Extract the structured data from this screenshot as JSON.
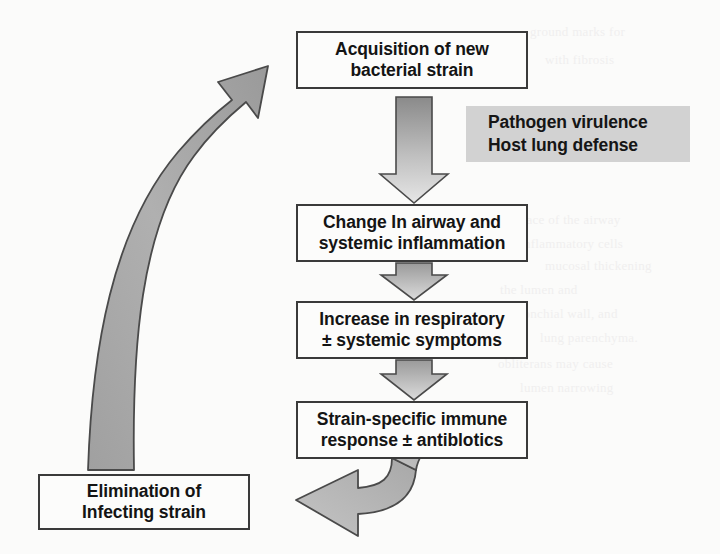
{
  "diagram": {
    "type": "cyclic-flowchart",
    "colors": {
      "box_border": "#3a3a3a",
      "box_fill": "#fcfcfb",
      "annotation_fill": "#d2d2d2",
      "arrow_fill_dark": "#8f8f8f",
      "arrow_fill_light": "#d8d8d8",
      "arrow_stroke": "#4a4a4a",
      "page_background": "#fbfbfa"
    },
    "nodes": [
      {
        "id": "acquisition",
        "line1": "Acquisition of new",
        "line2": "bacterial strain"
      },
      {
        "id": "inflammation",
        "line1": "Change In airway and",
        "line2": "systemic inflammation"
      },
      {
        "id": "symptoms",
        "line1": "Increase in respiratory",
        "line2": "± systemic symptoms"
      },
      {
        "id": "immune-response",
        "line1": "Strain-specific immune",
        "line2": "response ± antiblotics"
      },
      {
        "id": "elimination",
        "line1": "Elimination of",
        "line2": "Infecting strain"
      }
    ],
    "annotation": {
      "id": "modifiers",
      "line1": "Pathogen virulence",
      "line2": "Host lung defense"
    },
    "connectors": [
      {
        "id": "arrow-acquisition-to-inflammation",
        "kind": "block-arrow",
        "direction": "down"
      },
      {
        "id": "arrow-inflammation-to-symptoms",
        "kind": "block-arrow",
        "direction": "down"
      },
      {
        "id": "arrow-symptoms-to-immune-response",
        "kind": "block-arrow",
        "direction": "down"
      },
      {
        "id": "arrow-immune-response-to-elimination",
        "kind": "curved-arrow",
        "direction": "left"
      },
      {
        "id": "arrow-elimination-to-acquisition",
        "kind": "curved-arrow",
        "direction": "up-right"
      }
    ]
  },
  "background_text": {
    "note": "faint illegible bleed-through from the reverse side of the scanned page",
    "lines": [
      "ground marks for",
      "with fibrosis",
      "surface of the airway",
      "inflammatory cells",
      "mucosal thickening",
      "the lumen and",
      "bronchial wall, and",
      "lung parenchyma.",
      "obliterans may cause",
      "lumen narrowing"
    ]
  }
}
